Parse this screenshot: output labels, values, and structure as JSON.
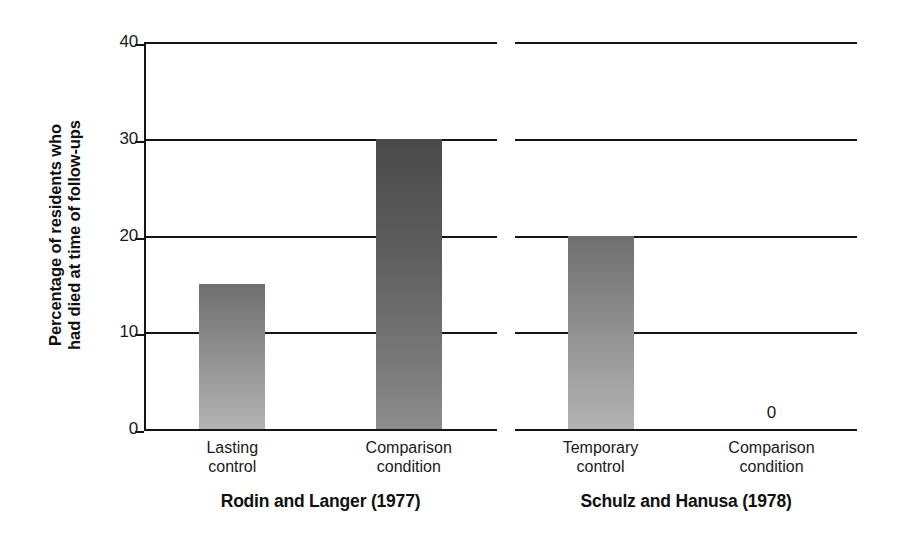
{
  "chart_data": {
    "type": "bar",
    "title": "",
    "subtitle": "",
    "xlabel": "",
    "ylabel_line1": "Percentage of residents who",
    "ylabel_line2": "had died at time of follow-ups",
    "ylim": [
      0,
      40
    ],
    "yticks": [
      0,
      10,
      20,
      30,
      40
    ],
    "ytick_labels": [
      "0",
      "10",
      "20",
      "30",
      "40"
    ],
    "grid": true,
    "grid_axis": "y",
    "legend": false,
    "legend_position": "none",
    "panels": [
      {
        "caption": "Rodin and Langer (1977)",
        "categories": [
          "Lasting control",
          "Comparison condition"
        ],
        "category_lines": [
          [
            "Lasting",
            "control"
          ],
          [
            "Comparison",
            "condition"
          ]
        ],
        "values": [
          15,
          30
        ],
        "value_annotations": [
          "",
          ""
        ],
        "bar_shades": [
          "light",
          "dark"
        ]
      },
      {
        "caption": "Schulz and Hanusa (1978)",
        "categories": [
          "Temporary control",
          "Comparison condition"
        ],
        "category_lines": [
          [
            "Temporary",
            "control"
          ],
          [
            "Comparison",
            "condition"
          ]
        ],
        "values": [
          20,
          0
        ],
        "value_annotations": [
          "",
          "0"
        ],
        "bar_shades": [
          "light",
          "light"
        ]
      }
    ]
  },
  "colors": {
    "background": "#ffffff",
    "axis": "#151515",
    "text": "#1a1a1a",
    "bar_light_top": "#6f6f6f",
    "bar_light_bottom": "#b2b2b2",
    "bar_dark_top": "#4a4a4a",
    "bar_dark_bottom": "#8d8d8d"
  }
}
